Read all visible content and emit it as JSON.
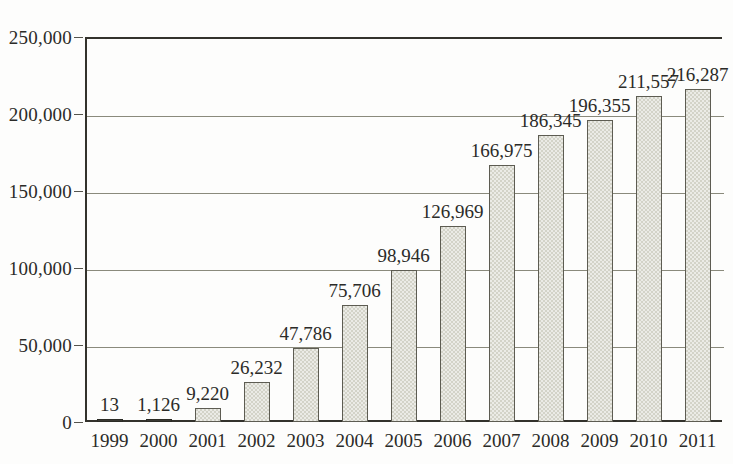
{
  "chart_data": {
    "type": "bar",
    "title": "",
    "xlabel": "",
    "ylabel": "",
    "ylim": [
      0,
      250000
    ],
    "ytick_step": 50000,
    "grid": true,
    "legend": "none",
    "categories": [
      "1999",
      "2000",
      "2001",
      "2002",
      "2003",
      "2004",
      "2005",
      "2006",
      "2007",
      "2008",
      "2009",
      "2010",
      "2011"
    ],
    "values": [
      13,
      1126,
      9220,
      26232,
      47786,
      75706,
      98946,
      126969,
      166975,
      186345,
      196355,
      211557,
      216287
    ],
    "value_labels": [
      "13",
      "1,126",
      "9,220",
      "26,232",
      "47,786",
      "75,706",
      "98,946",
      "126,969",
      "166,975",
      "186,345",
      "196,355",
      "211,557",
      "216,287"
    ],
    "ytick_labels": [
      "250,000",
      "200,000",
      "150,000",
      "100,000",
      "50,000",
      "0"
    ],
    "ytick_values": [
      250000,
      200000,
      150000,
      100000,
      50000,
      0
    ],
    "colors": {
      "bar_fill": "#d3d3c8",
      "bar_stroke": "#5d5c52",
      "axis": "#33322c",
      "grid": "#8a8a7c",
      "text": "#2b2b28",
      "background": "#fdfdfc"
    }
  },
  "clipped_header": {
    "left_text": "",
    "right_text": ""
  }
}
